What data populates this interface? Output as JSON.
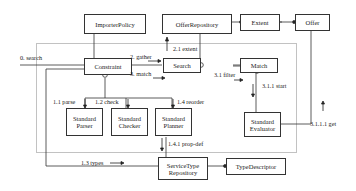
{
  "diagram": {
    "type": "UML collaboration diagram",
    "boxes": {
      "importer_policy": "ImporterPolicy",
      "offer_repository": "OfferRepository",
      "extent": "Extent",
      "offer": "Offer",
      "constraint": "Constraint",
      "search": "Search",
      "match": "Match",
      "standard_parser": "Standard Parser",
      "standard_checker": "Standard Checker",
      "standard_planner": "Standard Planner",
      "standard_evaluator": "Standard Evaluator",
      "service_type_repository": "ServiceType Repository",
      "type_descriptor": "TypeDescriptor"
    },
    "messages": {
      "m0": "0. search",
      "m2": "2. gather",
      "m3": "3. match",
      "m21": "2.1 extent",
      "m31": "3.1 filter",
      "m311": "3.1.1 start",
      "m3111": "3.1.1.1 get",
      "m11": "1.1 parse",
      "m12": "1.2 check",
      "m14": "1.4 reorder",
      "m141": "1.4.1 prop-def",
      "m13": "1.3 types"
    }
  }
}
